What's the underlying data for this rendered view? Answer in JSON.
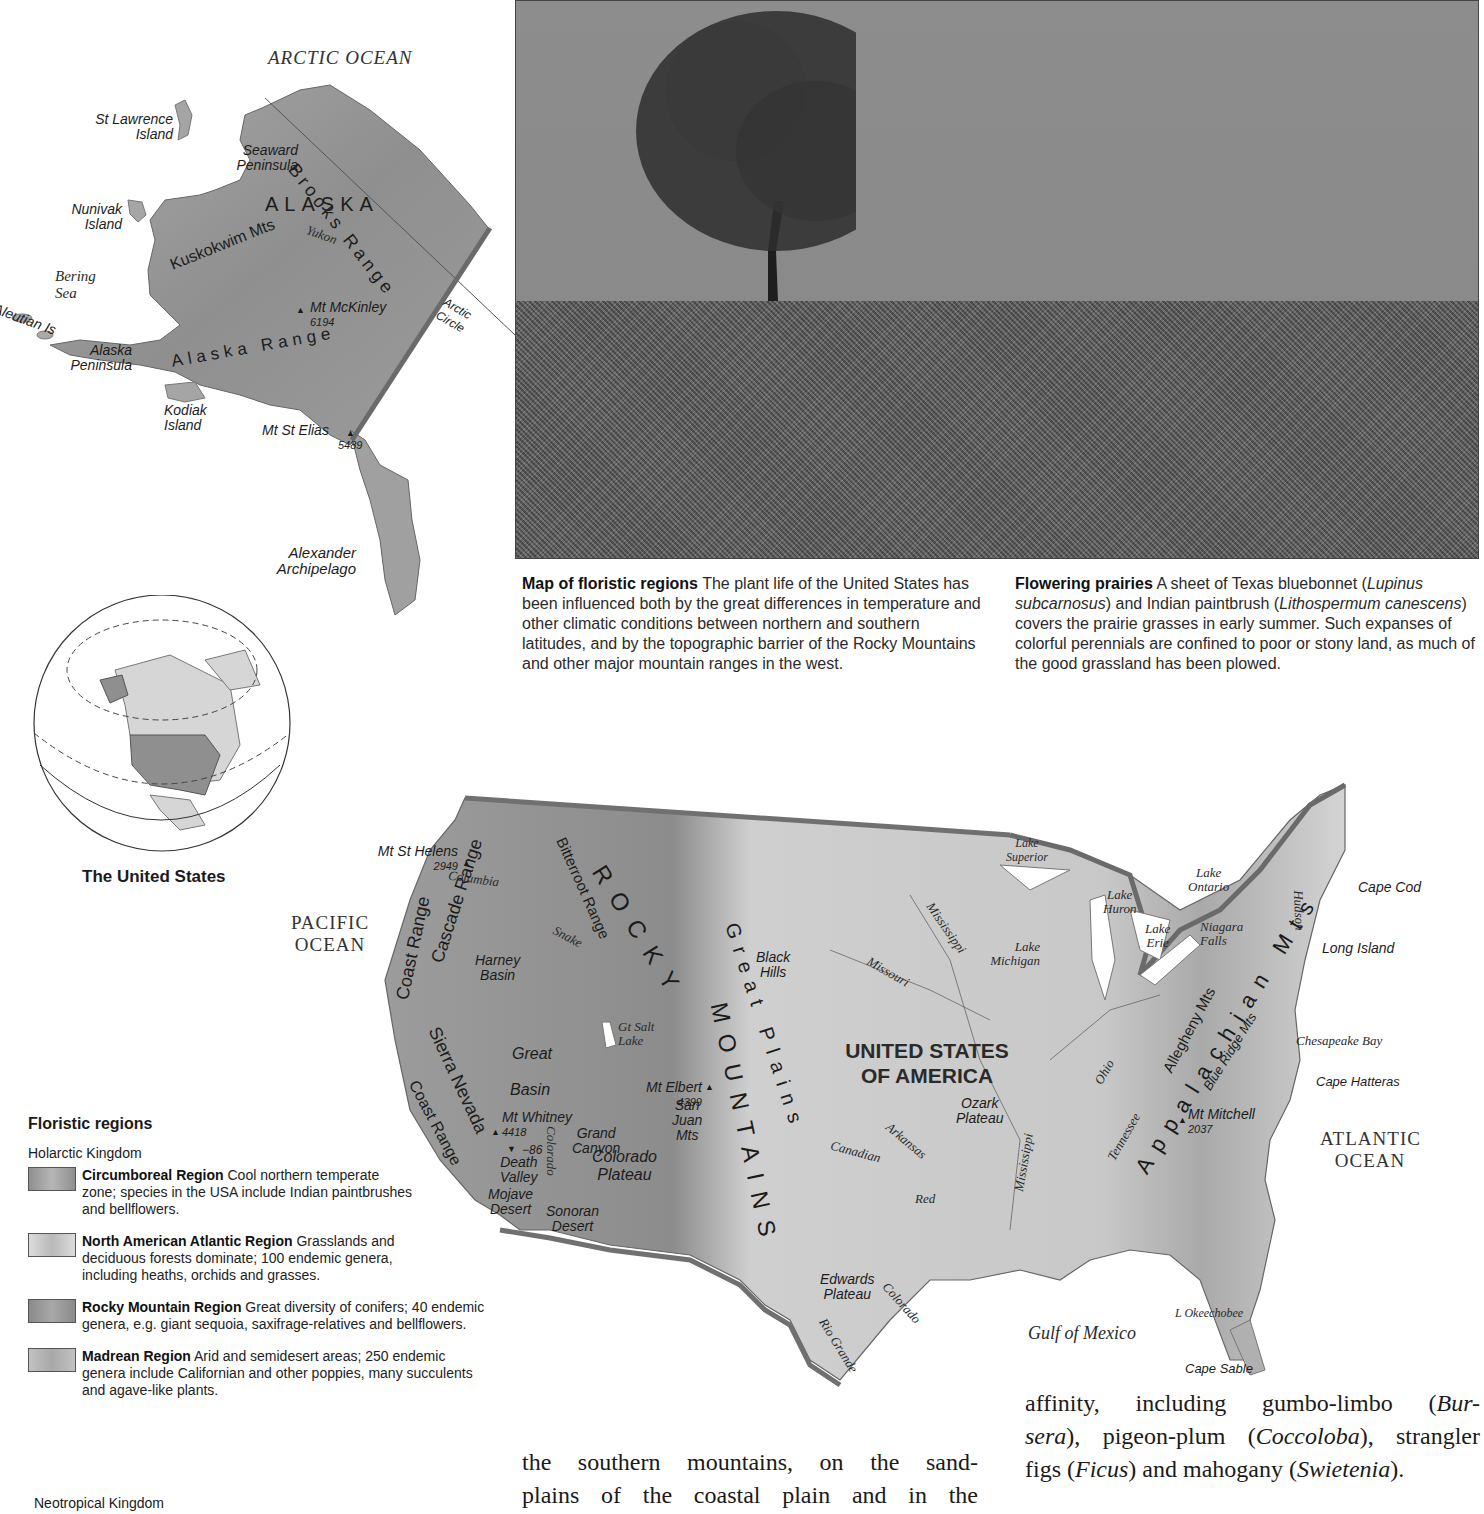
{
  "alaska_map": {
    "ocean_label": "ARCTIC OCEAN",
    "state_label": "ALASKA",
    "features": {
      "st_lawrence": [
        "St Lawrence",
        "Island"
      ],
      "seaward": [
        "Seaward",
        "Peninsula"
      ],
      "nunivak": [
        "Nunivak",
        "Island"
      ],
      "bering": [
        "Bering",
        "Sea"
      ],
      "aleutian": "Aleutian Is",
      "alaska_peninsula": [
        "Alaska",
        "Peninsula"
      ],
      "kodiak": [
        "Kodiak",
        "Island"
      ],
      "brooks_range": "Brooks Range",
      "kuskokwim": "Kuskokwim Mts",
      "yukon": "Yukon",
      "alaska_range": "Alaska Range",
      "arctic_circle": [
        "Arctic",
        "Circle"
      ],
      "alexander": [
        "Alexander",
        "Archipelago"
      ]
    },
    "peaks": [
      {
        "name": "Mt McKinley",
        "elevation": "6194"
      },
      {
        "name": "Mt St Elias",
        "elevation": "5489"
      }
    ]
  },
  "globe": {
    "caption": "The United States"
  },
  "photo": {
    "subject": "Lone tree on a hill of flowering prairie"
  },
  "captions": {
    "map": {
      "title": "Map of floristic regions",
      "text": "The plant life of the United States has been influenced both by the great differences in temperature and other climatic conditions between northern and southern latitudes, and by the topographic barrier of the Rocky Mountains and other major mountain ranges in the west."
    },
    "photo": {
      "title": "Flowering prairies",
      "text_1": "A sheet of Texas bluebonnet (",
      "italic_1": "Lupinus subcarnosus",
      "text_2": ") and Indian paintbrush (",
      "italic_2": "Lithospermum canescens",
      "text_3": ") covers the prairie grasses in early summer. Such expanses of colorful perennials are confined to poor or stony land, as much of the good grassland has been plowed."
    }
  },
  "us_map": {
    "country": [
      "UNITED STATES",
      "OF AMERICA"
    ],
    "oceans": {
      "pacific": [
        "PACIFIC",
        "OCEAN"
      ],
      "atlantic": [
        "ATLANTIC",
        "OCEAN"
      ],
      "gulf": "Gulf of Mexico"
    },
    "ranges": {
      "rocky": "ROCKY",
      "mountains": "MOUNTAINS",
      "cascade": "Cascade Range",
      "coast_north": "Coast Range",
      "coast_south": "Coast Range",
      "sierra": "Sierra Nevada",
      "bitterroot": "Bitterroot Range",
      "great_plains": "Great Plains",
      "appalachian": "Appalachian Mts",
      "allegheny": "Allegheny Mts",
      "blue_ridge": "Blue Ridge Mts"
    },
    "regions": {
      "harney": [
        "Harney",
        "Basin"
      ],
      "great_basin_1": "Great",
      "great_basin_2": "Basin",
      "black_hills": [
        "Black",
        "Hills"
      ],
      "grand_canyon": [
        "Grand",
        "Canyon"
      ],
      "colorado_plateau": [
        "Colorado",
        "Plateau"
      ],
      "san_juan": [
        "San",
        "Juan",
        "Mts"
      ],
      "death_valley": [
        "Death",
        "Valley"
      ],
      "mojave": [
        "Mojave",
        "Desert"
      ],
      "sonoran": [
        "Sonoran",
        "Desert"
      ],
      "ozark": [
        "Ozark",
        "Plateau"
      ],
      "edwards": [
        "Edwards",
        "Plateau"
      ],
      "niagara": [
        "Niagara",
        "Falls"
      ]
    },
    "peaks": [
      {
        "name": "Mt St Helens",
        "elevation": "2949"
      },
      {
        "name": "Mt Whitney",
        "elevation": "4418"
      },
      {
        "name": "Death Valley low",
        "elevation": "−86"
      },
      {
        "name": "Mt Elbert",
        "elevation": "4399"
      },
      {
        "name": "Mt Mitchell",
        "elevation": "2037"
      }
    ],
    "rivers": {
      "columbia": "Columbia",
      "snake": "Snake",
      "colorado_w": "Colorado",
      "missouri": "Missouri",
      "mississippi_n": "Mississippi",
      "mississippi_s": "Mississippi",
      "arkansas": "Arkansas",
      "canadian": "Canadian",
      "red": "Red",
      "ohio": "Ohio",
      "tennessee": "Tennessee",
      "hudson": "Hudson",
      "colorado_tx": "Colorado",
      "rio_grande": "Rio Grande"
    },
    "lakes": {
      "gt_salt": [
        "Gt Salt",
        "Lake"
      ],
      "superior": [
        "Lake",
        "Superior"
      ],
      "michigan": [
        "Lake",
        "Michigan"
      ],
      "huron": [
        "Lake",
        "Huron"
      ],
      "erie": [
        "Lake",
        "Erie"
      ],
      "ontario": [
        "Lake",
        "Ontario"
      ],
      "okeechobee": "L Okeechobee"
    },
    "capes": {
      "cape_cod": "Cape Cod",
      "long_island": "Long Island",
      "chesapeake": "Chesapeake Bay",
      "hatteras": "Cape Hatteras",
      "sable": "Cape Sable"
    }
  },
  "legend": {
    "title": "Floristic regions",
    "kingdom_1": "Holarctic Kingdom",
    "items": [
      {
        "name": "Circumboreal Region",
        "desc": "Cool northern temperate zone; species in the USA include Indian paintbrushes and bellflowers.",
        "color": "#9a9a9a"
      },
      {
        "name": "North American Atlantic Region",
        "desc": "Grasslands and deciduous forests dominate; 100 endemic genera, including heaths, orchids and grasses.",
        "color": "#d2d2d2"
      },
      {
        "name": "Rocky Mountain Region",
        "desc": "Great diversity of conifers; 40 endemic genera, e.g. giant sequoia, saxifrage-relatives and bellflowers.",
        "color": "#8e8e8e"
      },
      {
        "name": "Madrean Region",
        "desc": "Arid and semidesert areas; 250 endemic genera include Californian and other poppies, many succulents and agave-like plants.",
        "color": "#bdbdbd"
      }
    ],
    "kingdom_2": "Neotropical Kingdom"
  },
  "body_text": {
    "left_1": "the southern mountains, on the sand-",
    "left_2": "plains of the coastal plain and in the",
    "right_1": "affinity, including gumbo-limbo (",
    "right_1i": "Bur-",
    "right_2i": "sera",
    "right_2": "), pigeon-plum (",
    "right_2i2": "Coccoloba",
    "right_2b": "), strangler",
    "right_3": "figs (",
    "right_3i": "Ficus",
    "right_3b": ") and mahogany (",
    "right_3i2": "Swietenia",
    "right_3c": ")."
  }
}
